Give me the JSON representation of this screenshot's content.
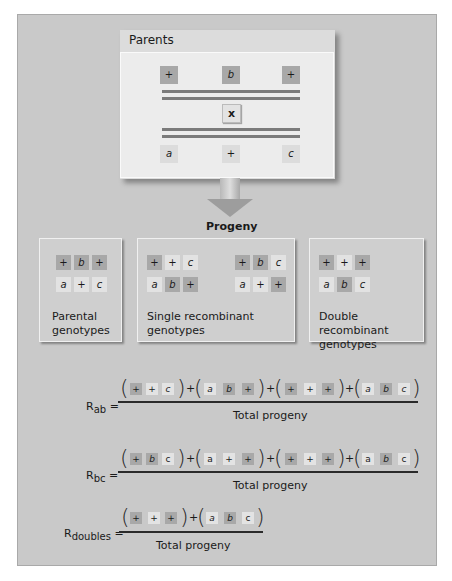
{
  "parents": {
    "title": "Parents",
    "top_chromosome": [
      "+",
      "b",
      "+"
    ],
    "cross_symbol": "x",
    "bottom_chromosome": [
      "a",
      "+",
      "c"
    ]
  },
  "progeny": {
    "title": "Progeny",
    "groups": [
      {
        "label_line1": "Parental",
        "label_line2": "genotypes",
        "genotypes": [
          [
            "+",
            "b",
            "+"
          ],
          [
            "a",
            "+",
            "c"
          ]
        ]
      },
      {
        "label_line1": "Single recombinant",
        "label_line2": "genotypes",
        "genotypes": [
          [
            "+",
            "+",
            "c"
          ],
          [
            "a",
            "b",
            "+"
          ],
          [
            "+",
            "b",
            "c"
          ],
          [
            "a",
            "+",
            "+"
          ]
        ]
      },
      {
        "label_line1": "Double recombinant",
        "label_line2": "genotypes",
        "genotypes": [
          [
            "+",
            "+",
            "+"
          ],
          [
            "a",
            "b",
            "c"
          ]
        ]
      }
    ]
  },
  "equations": [
    {
      "label": "R",
      "subscript": "ab",
      "equals": "=",
      "terms": [
        [
          "+",
          "+",
          "c"
        ],
        [
          "a",
          "b",
          "+"
        ],
        [
          "+",
          "+",
          "+"
        ],
        [
          "a",
          "b",
          "c"
        ]
      ],
      "denominator": "Total progeny"
    },
    {
      "label": "R",
      "subscript": "bc",
      "equals": "=",
      "terms": [
        [
          "+",
          "b",
          "c"
        ],
        [
          "a",
          "+",
          "+"
        ],
        [
          "+",
          "+",
          "+"
        ],
        [
          "a",
          "b",
          "c"
        ]
      ],
      "denominator": "Total progeny"
    },
    {
      "label": "R",
      "subscript": "doubles",
      "equals": "=",
      "terms": [
        [
          "+",
          "+",
          "+"
        ],
        [
          "a",
          "b",
          "c"
        ]
      ],
      "denominator": "Total progeny"
    }
  ],
  "operators": {
    "plus": "+",
    "open_paren": "(",
    "close_paren": ")"
  },
  "colors": {
    "panel": "#c9c9c9",
    "parent_allele": "#a8a8a8",
    "recessive_allele": "#e2e2e2",
    "chromosome": "#7b7b7b"
  }
}
